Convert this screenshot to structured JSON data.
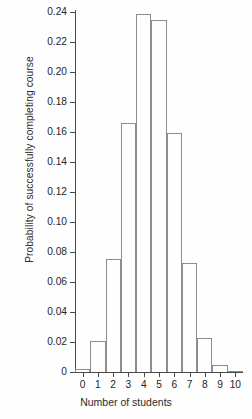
{
  "chart_data": {
    "type": "bar",
    "title": "",
    "xlabel": "Number of students",
    "ylabel": "Probability of successfully completing course",
    "categories": [
      "0",
      "1",
      "2",
      "3",
      "4",
      "5",
      "6",
      "7",
      "8",
      "9",
      "10"
    ],
    "values": [
      0.002,
      0.021,
      0.0755,
      0.166,
      0.2385,
      0.2345,
      0.1595,
      0.073,
      0.0228,
      0.0048,
      0.0005
    ],
    "xlim": [
      -0.5,
      10.5
    ],
    "ylim": [
      0,
      0.245
    ],
    "ytick_labels": [
      "0.24",
      "0.22",
      "0.20",
      "0.18",
      "0.16",
      "0.14",
      "0.12",
      "0.10",
      "0.08",
      "0.06",
      "0.04",
      "0.02",
      "0"
    ],
    "ytick_values": [
      0.24,
      0.22,
      0.2,
      0.18,
      0.16,
      0.14,
      0.12,
      0.1,
      0.08,
      0.06,
      0.04,
      0.02,
      0
    ],
    "xtick_labels": [
      "0",
      "1",
      "2",
      "3",
      "4",
      "5",
      "6",
      "7",
      "8",
      "9",
      "10"
    ],
    "grid": false,
    "legend": false,
    "bar_style": "outlined-unfilled",
    "bar_edge_color": "#8d8d8d",
    "axis_color": "#4a4a4a",
    "background_color": "#fefefe"
  }
}
